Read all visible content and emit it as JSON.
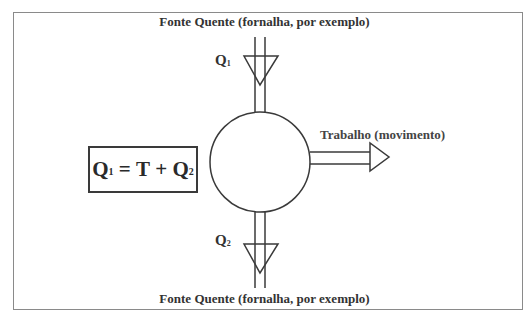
{
  "diagram": {
    "top_source_label": "Fonte Quente (fornalha, por exemplo)",
    "bottom_source_label": "Fonte Quente (fornalha, por exemplo)",
    "work_output_label": "Trabalho (movimento)",
    "heat_in": {
      "symbol": "Q",
      "subscript": "1"
    },
    "heat_out": {
      "symbol": "Q",
      "subscript": "2"
    },
    "equation": {
      "lhs_symbol": "Q",
      "lhs_subscript": "1",
      "equals": " = ",
      "term1": "T",
      "plus": " + ",
      "rhs_symbol": "Q",
      "rhs_subscript": "2"
    },
    "colors": {
      "line": "#3a3a3a",
      "frame": "#8a8a8a",
      "background": "#ffffff"
    }
  }
}
